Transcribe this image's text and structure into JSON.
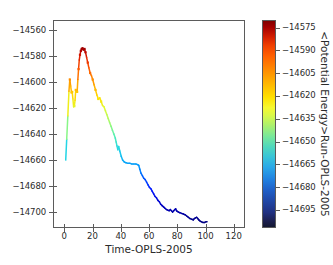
{
  "figure": {
    "background": "#ffffff",
    "axis_color": "#5b5b5b",
    "text_color": "#2b2b2b"
  },
  "axes": {
    "xlabel": "Time-OPLS-2005",
    "ylabel": "",
    "xticks": [
      "0",
      "20",
      "40",
      "60",
      "80",
      "100",
      "120"
    ],
    "yticks": [
      "-14560",
      "-14580",
      "-14600",
      "-14620",
      "-14640",
      "-14660",
      "-14680",
      "-14700"
    ]
  },
  "colorbar": {
    "label": "<Potential Energy>Run-OPLS-2005",
    "ticks": [
      "-14575",
      "-14590",
      "-14605",
      "-14620",
      "-14635",
      "-14650",
      "-14665",
      "-14680",
      "-14695"
    ],
    "colormap": "jet-reversed",
    "vmax": -14570,
    "vmin": -14707
  },
  "chart_data": {
    "type": "line",
    "title": "",
    "xlabel": "Time-OPLS-2005",
    "ylabel": "",
    "colorbar_label": "<Potential Energy>Run-OPLS-2005",
    "colormap": "jet",
    "grid": false,
    "legend": "none",
    "xlim": [
      -8,
      128
    ],
    "ylim": [
      -14712,
      -14552
    ],
    "color_scale": {
      "vmin": -14707,
      "vmax": -14570,
      "ticks": [
        -14575,
        -14590,
        -14605,
        -14620,
        -14635,
        -14650,
        -14665,
        -14680,
        -14695
      ]
    },
    "note": "Potential energy vs. simulation time; line colored by its own y-value using a jet colormap. Markers shown at sampled frames.",
    "x": [
      0.3,
      1.0,
      1.8,
      2.6,
      3.2,
      3.8,
      4.4,
      4.9,
      5.4,
      5.9,
      6.4,
      6.9,
      7.4,
      7.9,
      8.4,
      8.9,
      9.4,
      9.9,
      10.4,
      11.0,
      11.6,
      12.2,
      12.9,
      13.6,
      14.3,
      15.1,
      15.9,
      16.7,
      17.6,
      18.5,
      19.4,
      20.4,
      21.4,
      22.4,
      23.4,
      24.4,
      25.4,
      26.4,
      27.4,
      28.4,
      29.4,
      30.4,
      31.4,
      32.4,
      33.4,
      34.4,
      35.4,
      36.0,
      36.6,
      37.2,
      37.8,
      38.6,
      39.6,
      40.6,
      41.8,
      43.0,
      44.4,
      45.8,
      47.2,
      48.6,
      50.0,
      51.2,
      52.0,
      52.8,
      53.6,
      54.6,
      55.6,
      56.6,
      57.6,
      58.6,
      59.6,
      60.6,
      61.6,
      62.6,
      63.6,
      64.6,
      65.6,
      66.6,
      67.6,
      68.6,
      69.6,
      70.6,
      71.6,
      72.6,
      73.6,
      74.4,
      75.2,
      76.0,
      76.8,
      77.6,
      78.2,
      78.8,
      79.4,
      80.2,
      81.2,
      82.4,
      83.6,
      84.8,
      86.0,
      87.2,
      88.4,
      89.6,
      90.6,
      91.4,
      92.2,
      93.0,
      93.8,
      94.6,
      95.6,
      96.6,
      97.6,
      98.6,
      99.6,
      100.4
    ],
    "y": [
      -14659.0,
      -14643.0,
      -14625.0,
      -14606.0,
      -14597.0,
      -14602.0,
      -14607.0,
      -14606.5,
      -14612.0,
      -14618.0,
      -14617.5,
      -14613.0,
      -14605.0,
      -14606.0,
      -14606.5,
      -14597.0,
      -14589.0,
      -14582.0,
      -14578.0,
      -14575.0,
      -14573.5,
      -14573.0,
      -14574.0,
      -14573.5,
      -14576.0,
      -14580.0,
      -14584.0,
      -14588.0,
      -14592.0,
      -14594.0,
      -14597.0,
      -14601.0,
      -14605.0,
      -14609.0,
      -14612.0,
      -14611.0,
      -14614.0,
      -14617.0,
      -14618.0,
      -14621.0,
      -14624.0,
      -14627.0,
      -14630.0,
      -14633.0,
      -14636.0,
      -14639.0,
      -14642.0,
      -14645.0,
      -14648.0,
      -14651.0,
      -14648.5,
      -14652.0,
      -14656.0,
      -14659.0,
      -14660.5,
      -14661.0,
      -14661.5,
      -14661.5,
      -14662.0,
      -14662.0,
      -14662.0,
      -14662.5,
      -14663.0,
      -14666.0,
      -14669.0,
      -14671.0,
      -14673.0,
      -14674.0,
      -14676.0,
      -14678.0,
      -14680.0,
      -14681.0,
      -14683.0,
      -14685.0,
      -14687.0,
      -14688.0,
      -14690.0,
      -14691.0,
      -14693.0,
      -14694.0,
      -14695.0,
      -14696.0,
      -14697.0,
      -14697.5,
      -14698.0,
      -14697.0,
      -14698.0,
      -14699.0,
      -14698.0,
      -14697.0,
      -14696.5,
      -14698.0,
      -14698.5,
      -14699.0,
      -14699.5,
      -14700.0,
      -14700.5,
      -14701.0,
      -14702.0,
      -14703.0,
      -14704.0,
      -14704.5,
      -14705.0,
      -14704.0,
      -14703.5,
      -14703.0,
      -14704.0,
      -14705.0,
      -14706.0,
      -14706.5,
      -14707.0,
      -14707.0,
      -14706.5,
      -14706.5
    ],
    "markers_x": [
      3.2,
      4.4,
      4.9,
      6.4,
      7.4,
      8.4,
      9.4,
      10.4,
      11.0,
      11.6,
      12.2,
      12.9,
      13.6,
      14.3,
      15.9,
      17.6,
      19.4,
      21.4,
      23.4,
      25.4
    ],
    "markers_y": [
      -14597.0,
      -14607.0,
      -14606.5,
      -14617.5,
      -14605.0,
      -14606.5,
      -14589.0,
      -14578.0,
      -14575.0,
      -14573.5,
      -14573.0,
      -14574.0,
      -14573.5,
      -14576.0,
      -14584.0,
      -14592.0,
      -14597.0,
      -14605.0,
      -14612.0,
      -14614.0
    ]
  }
}
